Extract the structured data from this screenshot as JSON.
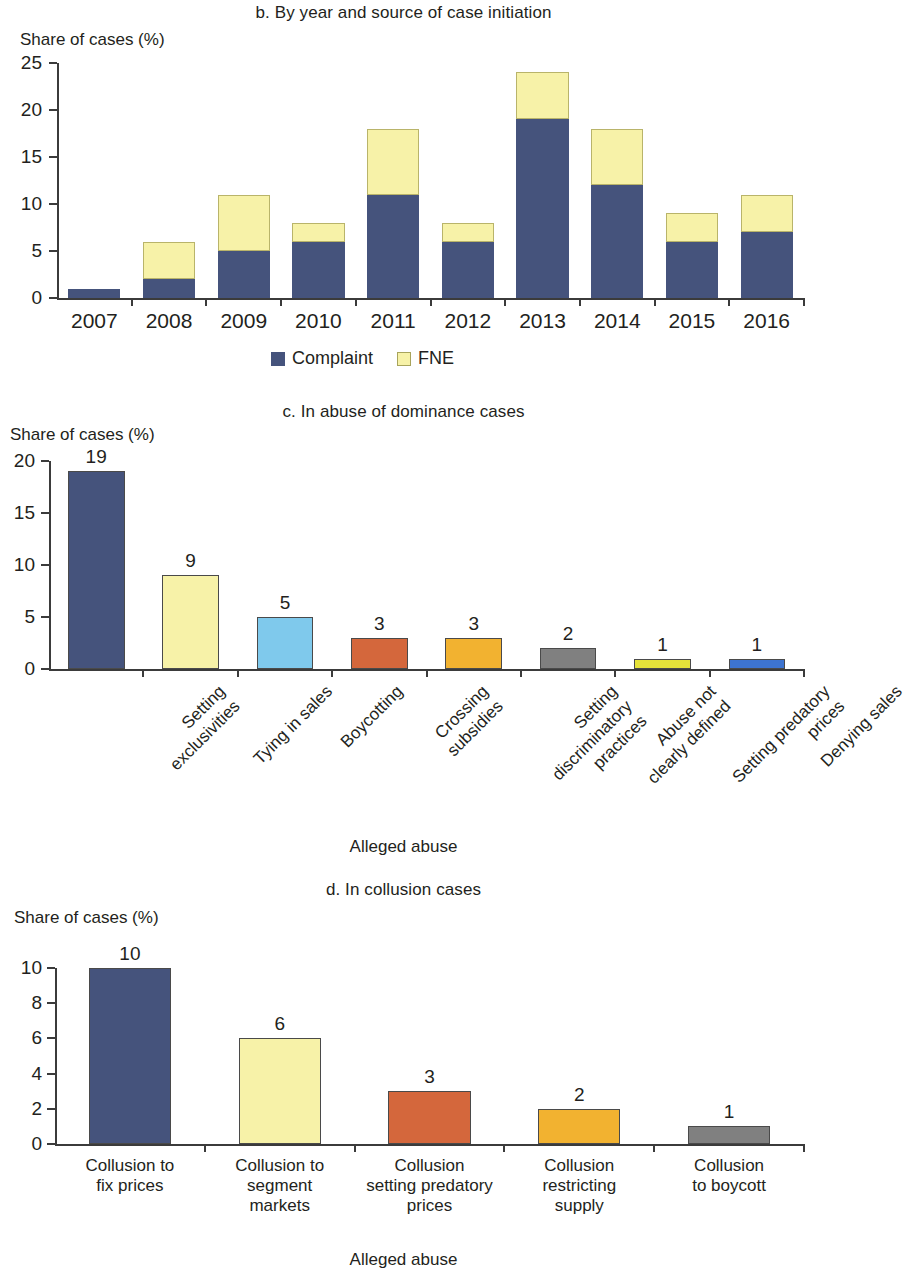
{
  "colors": {
    "complaint": "#45537c",
    "fne": "#f7f2a8",
    "lightblue": "#7fc9ec",
    "orange_red": "#d4673c",
    "amber": "#f2b230",
    "gray": "#808080",
    "bright_yellow": "#e6e33a",
    "blue": "#3d74d0",
    "axis": "#3b3b3b",
    "text": "#231f20",
    "bar_outline": "#4a4a4a"
  },
  "panel_b": {
    "title": "b. By year and source of case initiation",
    "ylabel": "Share of cases (%)",
    "legend": [
      {
        "label": "Complaint",
        "color": "#45537c"
      },
      {
        "label": "FNE",
        "color": "#f7f2a8"
      }
    ]
  },
  "panel_c": {
    "title": "c. In abuse of dominance cases",
    "ylabel": "Share of cases (%)",
    "xlabel": "Alleged abuse"
  },
  "panel_d": {
    "title": "d. In collusion cases",
    "ylabel": "Share of cases (%)",
    "xlabel": "Alleged abuse"
  },
  "chart_data": [
    {
      "type": "bar",
      "id": "panel_b",
      "title": "b. By year and source of case initiation",
      "stacked": true,
      "xlabel": "",
      "ylabel": "Share of cases (%)",
      "ylim": [
        0,
        25
      ],
      "yticks": [
        0,
        5,
        10,
        15,
        20,
        25
      ],
      "grid": false,
      "legend": [
        "Complaint",
        "FNE"
      ],
      "legend_position": "bottom-center",
      "categories": [
        "2007",
        "2008",
        "2009",
        "2010",
        "2011",
        "2012",
        "2013",
        "2014",
        "2015",
        "2016"
      ],
      "series": [
        {
          "name": "Complaint",
          "color": "#45537c",
          "values": [
            1,
            2,
            5,
            6,
            11,
            6,
            19,
            12,
            6,
            7
          ]
        },
        {
          "name": "FNE",
          "color": "#f7f2a8",
          "values": [
            0,
            4,
            6,
            2,
            7,
            2,
            5,
            6,
            3,
            4
          ]
        }
      ],
      "totals": [
        1,
        6,
        11,
        8,
        18,
        8,
        24,
        18,
        9,
        11
      ]
    },
    {
      "type": "bar",
      "id": "panel_c",
      "title": "c. In abuse of dominance cases",
      "stacked": false,
      "xlabel": "Alleged abuse",
      "ylabel": "Share of cases (%)",
      "ylim": [
        0,
        20
      ],
      "yticks": [
        0,
        5,
        10,
        15,
        20
      ],
      "grid": false,
      "categories": [
        "Setting\nexclusivities",
        "Tying in sales",
        "Boycotting",
        "Crossing\nsubsidies",
        "Setting\ndiscriminatory\npractices",
        "Abuse not\nclearly defined",
        "Setting predatory\nprices",
        "Denying sales"
      ],
      "values": [
        19,
        9,
        5,
        3,
        3,
        2,
        1,
        1
      ],
      "colors": [
        "#45537c",
        "#f7f2a8",
        "#7fc9ec",
        "#d4673c",
        "#f2b230",
        "#808080",
        "#e6e33a",
        "#3d74d0"
      ],
      "data_labels": [
        "19",
        "9",
        "5",
        "3",
        "3",
        "2",
        "1",
        "1"
      ]
    },
    {
      "type": "bar",
      "id": "panel_d",
      "title": "d. In collusion cases",
      "stacked": false,
      "xlabel": "Alleged abuse",
      "ylabel": "Share of cases (%)",
      "ylim": [
        0,
        10
      ],
      "yticks": [
        0,
        2,
        4,
        6,
        8,
        10
      ],
      "grid": false,
      "categories": [
        "Collusion to\nfix prices",
        "Collusion to\nsegment\nmarkets",
        "Collusion\nsetting predatory\nprices",
        "Collusion\nrestricting\nsupply",
        "Collusion\nto boycott"
      ],
      "values": [
        10,
        6,
        3,
        2,
        1
      ],
      "colors": [
        "#45537c",
        "#f7f2a8",
        "#d4673c",
        "#f2b230",
        "#808080"
      ],
      "data_labels": [
        "10",
        "6",
        "3",
        "2",
        "1"
      ]
    }
  ]
}
